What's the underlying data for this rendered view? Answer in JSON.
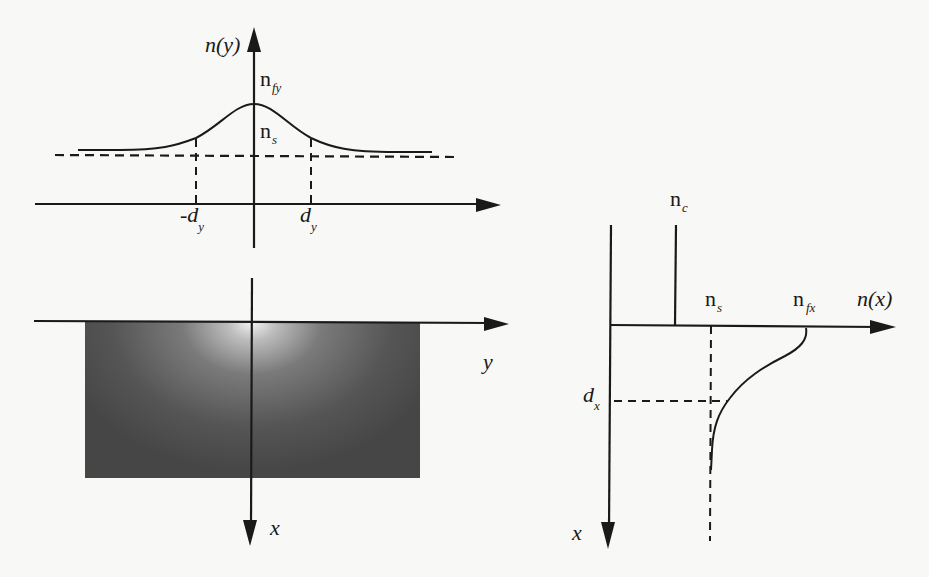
{
  "top_profile": {
    "axis_vertical_label": "n(y)",
    "axis_horizontal_label": "",
    "peak_label_main": "n",
    "peak_label_sub": "fy",
    "substrate_label_main": "n",
    "substrate_label_sub": "s",
    "left_marker_main": "-d",
    "left_marker_sub": "y",
    "right_marker_main": "d",
    "right_marker_sub": "y"
  },
  "cross_section": {
    "horizontal_axis_label": "y",
    "vertical_axis_label": "x",
    "waveguide_fill_dark": "#484848",
    "waveguide_fill_bright": "#f2f2f2"
  },
  "depth_profile": {
    "horizontal_axis_label": "n(x)",
    "vertical_axis_label": "x",
    "cover_label_main": "n",
    "cover_label_sub": "c",
    "substrate_label_main": "n",
    "substrate_label_sub": "s",
    "surface_label_main": "n",
    "surface_label_sub": "fx",
    "depth_marker_main": "d",
    "depth_marker_sub": "x"
  },
  "colors": {
    "line": "#1a1a1a",
    "background": "#f8f8f6"
  }
}
